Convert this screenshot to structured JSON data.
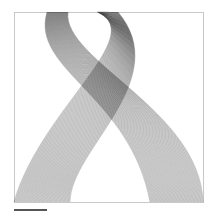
{
  "artwork": {
    "frame": {
      "x": 14,
      "y": 12,
      "width": 189,
      "height": 190,
      "stroke": "#c8c8c8"
    },
    "scale_bar": {
      "x1": 14,
      "y1": 210,
      "x2": 47,
      "y2": 210,
      "stroke": "#555555"
    },
    "line_color": "#000000",
    "ribbons": [
      {
        "name": "ribbon-left-to-right",
        "count": 70,
        "opacity": 0.55,
        "edge_a": [
          [
            47,
            12
          ],
          [
            30,
            70
          ],
          [
            130,
            95
          ],
          [
            150,
            202
          ]
        ],
        "edge_b": [
          [
            68,
            12
          ],
          [
            62,
            60
          ],
          [
            200,
            110
          ],
          [
            203,
            202
          ]
        ]
      },
      {
        "name": "ribbon-right-to-left",
        "count": 70,
        "opacity": 0.55,
        "edge_a": [
          [
            97,
            12
          ],
          [
            150,
            35
          ],
          [
            40,
            110
          ],
          [
            14,
            202
          ]
        ],
        "edge_b": [
          [
            118,
            12
          ],
          [
            175,
            80
          ],
          [
            70,
            150
          ],
          [
            70,
            202
          ]
        ]
      }
    ]
  }
}
